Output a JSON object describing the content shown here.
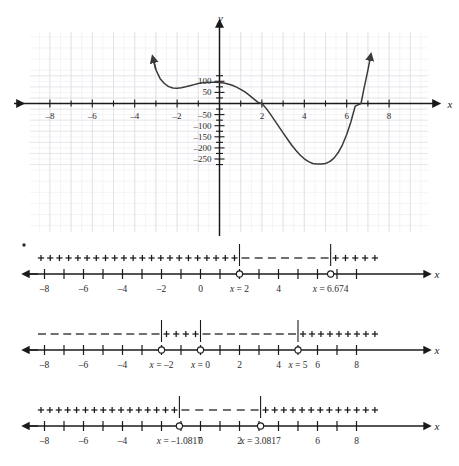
{
  "figure": {
    "bullet_marker": "•"
  },
  "graph": {
    "x_axis_label": "x",
    "y_axis_label": "y",
    "x_ticks": [
      -8,
      -6,
      -4,
      -2,
      2,
      4,
      6,
      8
    ],
    "x_tick_labels": [
      "–8",
      "–6",
      "–4",
      "–2",
      "2",
      "4",
      "6",
      "8"
    ],
    "y_ticks": [
      100,
      50,
      -50,
      -100,
      -150,
      -200,
      -250
    ],
    "y_tick_labels": [
      "100",
      "50",
      "–50",
      "–100",
      "–150",
      "–200",
      "–250"
    ],
    "grid": true
  },
  "chart_data": {
    "type": "line",
    "title": "",
    "xlabel": "x",
    "ylabel": "y",
    "xlim": [
      -9.2,
      9.2
    ],
    "ylim": [
      -290,
      130
    ],
    "grid": true,
    "x_ticks": [
      -8,
      -6,
      -4,
      -2,
      2,
      4,
      6,
      8
    ],
    "y_ticks": [
      100,
      50,
      -50,
      -100,
      -150,
      -200,
      -250
    ],
    "series": [
      {
        "name": "f(x)",
        "arrow_start": true,
        "arrow_end": true,
        "x": [
          -3.1,
          -3.0,
          -2.8,
          -2.6,
          -2.4,
          -2.2,
          -2.0,
          -1.8,
          -1.6,
          -1.4,
          -1.2,
          -1.0,
          -0.8,
          -0.6,
          -0.4,
          -0.2,
          0.0,
          0.2,
          0.4,
          0.6,
          0.8,
          1.0,
          1.2,
          1.4,
          1.6,
          1.8,
          2.0,
          2.2,
          2.4,
          2.6,
          2.8,
          3.0,
          3.2,
          3.4,
          3.6,
          3.8,
          4.0,
          4.2,
          4.4,
          4.6,
          4.8,
          5.0,
          5.2,
          5.4,
          5.6,
          5.8,
          6.0,
          6.2,
          6.4,
          6.674,
          6.8,
          7.0,
          7.1
        ],
        "y": [
          190,
          152,
          112,
          90,
          76,
          70,
          69,
          71,
          75,
          80,
          85,
          90,
          93,
          95,
          96,
          96,
          95,
          92,
          88,
          82,
          74,
          64,
          52,
          38,
          22,
          6,
          0,
          -22,
          -48,
          -76,
          -104,
          -132,
          -160,
          -187,
          -211,
          -232,
          -249,
          -262,
          -270,
          -273,
          -272,
          -270,
          -262,
          -246,
          -221,
          -186,
          -140,
          -82,
          -12,
          0,
          60,
          150,
          200
        ]
      }
    ],
    "features": {
      "local_minimum_left": {
        "x": -2,
        "y": 70
      },
      "local_maximum": {
        "x": -0.3,
        "y": 96
      },
      "x_intercepts": [
        2,
        6.674
      ],
      "global_minimum": {
        "x": 5,
        "y": -272
      }
    }
  },
  "sign_lines": [
    {
      "id": "first-derivative-chart",
      "axis_label": "x",
      "tick_values": [
        -8,
        -7,
        -6,
        -5,
        -4,
        -3,
        -2,
        -1,
        0,
        1,
        2,
        3,
        4,
        5,
        6,
        7,
        8
      ],
      "labeled_ticks": [
        {
          "value": -8,
          "label": "–8"
        },
        {
          "value": -6,
          "label": "–6"
        },
        {
          "value": -4,
          "label": "–4"
        },
        {
          "value": -2,
          "label": "–2"
        },
        {
          "value": 0,
          "label": "0"
        },
        {
          "value": 4,
          "label": "4"
        }
      ],
      "critical_points": [
        {
          "value": 2,
          "label": "x = 2",
          "marker": "open-circle"
        },
        {
          "value": 6.674,
          "label": "x = 6.674",
          "marker": "open-circle"
        }
      ],
      "intervals": [
        {
          "from": -9.2,
          "to": 2,
          "sign": "+"
        },
        {
          "from": 2,
          "to": 6.674,
          "sign": "–"
        },
        {
          "from": 6.674,
          "to": 9.2,
          "sign": "+"
        }
      ]
    },
    {
      "id": "second-chart",
      "axis_label": "x",
      "tick_values": [
        -8,
        -7,
        -6,
        -5,
        -4,
        -3,
        -2,
        -1,
        0,
        1,
        2,
        3,
        4,
        5,
        6,
        7,
        8
      ],
      "labeled_ticks": [
        {
          "value": -8,
          "label": "–8"
        },
        {
          "value": -6,
          "label": "–6"
        },
        {
          "value": -4,
          "label": "–4"
        },
        {
          "value": 2,
          "label": "2"
        },
        {
          "value": 4,
          "label": "4"
        },
        {
          "value": 6,
          "label": "6"
        },
        {
          "value": 8,
          "label": "8"
        }
      ],
      "critical_points": [
        {
          "value": -2,
          "label": "x = –2",
          "marker": "open-circle"
        },
        {
          "value": 0,
          "label": "x = 0",
          "marker": "open-circle"
        },
        {
          "value": 5,
          "label": "x = 5",
          "marker": "open-circle"
        }
      ],
      "intervals": [
        {
          "from": -9.2,
          "to": -2,
          "sign": "–"
        },
        {
          "from": -2,
          "to": 0,
          "sign": "+"
        },
        {
          "from": 0,
          "to": 5,
          "sign": "–"
        },
        {
          "from": 5,
          "to": 9.2,
          "sign": "+"
        }
      ]
    },
    {
      "id": "third-chart",
      "axis_label": "x",
      "tick_values": [
        -8,
        -7,
        -6,
        -5,
        -4,
        -3,
        -2,
        -1,
        0,
        1,
        2,
        3,
        4,
        5,
        6,
        7,
        8
      ],
      "labeled_ticks": [
        {
          "value": -8,
          "label": "–8"
        },
        {
          "value": -6,
          "label": "–6"
        },
        {
          "value": -4,
          "label": "–4"
        },
        {
          "value": 0,
          "label": "0"
        },
        {
          "value": 2,
          "label": "2"
        },
        {
          "value": 6,
          "label": "6"
        },
        {
          "value": 8,
          "label": "8"
        }
      ],
      "critical_points": [
        {
          "value": -1.0817,
          "label": "x = –1.0817",
          "marker": "open-circle"
        },
        {
          "value": 3.0817,
          "label": "x = 3.0817",
          "marker": "open-circle"
        }
      ],
      "intervals": [
        {
          "from": -9.2,
          "to": -1.0817,
          "sign": "+"
        },
        {
          "from": -1.0817,
          "to": 3.0817,
          "sign": "–"
        },
        {
          "from": 3.0817,
          "to": 9.2,
          "sign": "+"
        }
      ]
    }
  ],
  "colors": {
    "curve": "#3a3a3a",
    "axis": "#1a1a1a",
    "grid_minor": "#ececf2",
    "grid_major": "#dcdce4",
    "text": "#2b2b2b"
  }
}
